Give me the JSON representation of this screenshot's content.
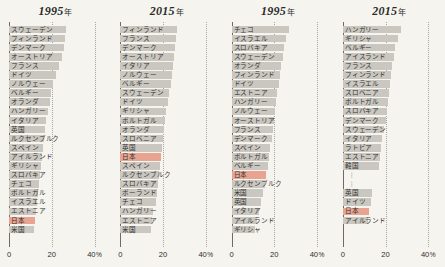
{
  "figure": {
    "background": "#f6f4ef",
    "bar_color": "#c9c7c0",
    "highlight_color": "#e9a391",
    "highlight_label": "日本"
  },
  "axis": {
    "ticks": [
      {
        "value": 0,
        "label": "0",
        "suffix": ""
      },
      {
        "value": 20,
        "label": "20",
        "suffix": ""
      },
      {
        "value": 40,
        "label": "40",
        "suffix": "%"
      }
    ],
    "min": 0,
    "max": 45,
    "unit": "%"
  },
  "chart_data": {
    "type": "bar",
    "orientation": "horizontal",
    "title": "",
    "xlabel": "%",
    "ylabel": "",
    "xlim": [
      0,
      45
    ],
    "grid": true,
    "legend": "none",
    "panels": [
      {
        "title": "1995",
        "title_unit": "年",
        "categories": [
          "スウェーデン",
          "フィンランド",
          "デンマーク",
          "オーストリア",
          "フランス",
          "ドイツ",
          "ノルウェー",
          "ベルギー",
          "オランダ",
          "ハンガリー",
          "イタリア",
          "英国",
          "ルクセンブルク",
          "スペイン",
          "アイルランド",
          "ギリシャ",
          "スロバキア",
          "チェコ",
          "ポルトガル",
          "イスラエル",
          "エストニア",
          "日本",
          "米国"
        ],
        "values": [
          26.5,
          26.0,
          25.5,
          25.0,
          23.5,
          22.0,
          20.5,
          19.5,
          19.0,
          18.0,
          17.5,
          17.0,
          16.5,
          16.0,
          15.5,
          15.0,
          14.5,
          14.0,
          13.5,
          13.0,
          12.5,
          12.0,
          11.5
        ],
        "highlighted": [
          "日本"
        ]
      },
      {
        "title": "2015",
        "title_unit": "年",
        "categories": [
          "フィンランド",
          "フランス",
          "デンマーク",
          "オーストリア",
          "イタリア",
          "ノルウェー",
          "ベルギー",
          "スウェーデン",
          "ドイツ",
          "ギリシャ",
          "ポルトガル",
          "オランダ",
          "スロベニア",
          "英国",
          "日本",
          "スペイン",
          "ルクセンブルク",
          "スロバキア",
          "ポーランド",
          "チェコ",
          "ハンガリー",
          "エストニア",
          "米国"
        ],
        "values": [
          26.5,
          26.0,
          25.5,
          25.0,
          24.5,
          24.0,
          23.5,
          23.0,
          22.5,
          21.5,
          21.0,
          20.5,
          20.0,
          19.5,
          19.0,
          18.5,
          18.0,
          17.5,
          17.0,
          16.5,
          15.5,
          15.0,
          14.5
        ],
        "highlighted": [
          "日本"
        ]
      },
      {
        "title": "1995",
        "title_unit": "年",
        "categories": [
          "チェコ",
          "イスラエル",
          "スロバキア",
          "スウェーデン",
          "オランダ",
          "フィンランド",
          "ドイツ",
          "エストニア",
          "ハンガリー",
          "ノルウェー",
          "オーストリア",
          "フランス",
          "デンマーク",
          "スペイン",
          "ポルトガル",
          "ベルギー",
          "日本",
          "ルクセンブルク",
          "米国",
          "英国",
          "イタリア",
          "アイルランド",
          "ギリシャ"
        ],
        "values": [
          27.0,
          25.5,
          24.5,
          24.0,
          23.0,
          22.5,
          22.0,
          21.5,
          21.0,
          20.5,
          20.0,
          19.5,
          19.0,
          18.0,
          17.5,
          17.0,
          16.0,
          15.5,
          14.5,
          14.0,
          13.0,
          12.0,
          11.0
        ],
        "highlighted": [
          "日本"
        ]
      },
      {
        "title": "2015",
        "title_unit": "年",
        "categories": [
          "ハンガリー",
          "ギリシャ",
          "ベルギー",
          "アイスランド",
          "フランス",
          "フィンランド",
          "イスラエル",
          "スロベニア",
          "ポルトガル",
          "スロバキア",
          "デンマーク",
          "スウェーデン",
          "イタリア",
          "ラトビア",
          "エストニア",
          "韓国",
          "",
          "",
          "英国",
          "ドイツ",
          "日本",
          "アイルランド"
        ],
        "values": [
          27.0,
          26.0,
          24.5,
          24.0,
          23.0,
          22.5,
          22.0,
          21.5,
          21.0,
          20.5,
          20.0,
          19.5,
          18.5,
          18.0,
          17.5,
          17.0,
          0,
          0,
          13.5,
          13.0,
          12.5,
          12.0
        ],
        "gap_after_index": 15,
        "highlighted": [
          "日本"
        ]
      }
    ]
  }
}
